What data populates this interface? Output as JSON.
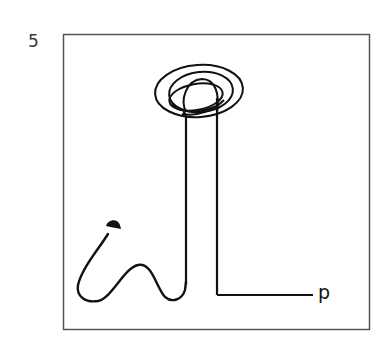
{
  "figure": {
    "panel_label": "5",
    "end_label": "p",
    "colors": {
      "stroke": "#111111",
      "frame": "#555555",
      "background": "#ffffff"
    },
    "elements": [
      "frame",
      "start-dot",
      "wavy-path",
      "ascending-line",
      "loop-cluster",
      "descending-line",
      "horizontal-exit",
      "end-label"
    ]
  }
}
